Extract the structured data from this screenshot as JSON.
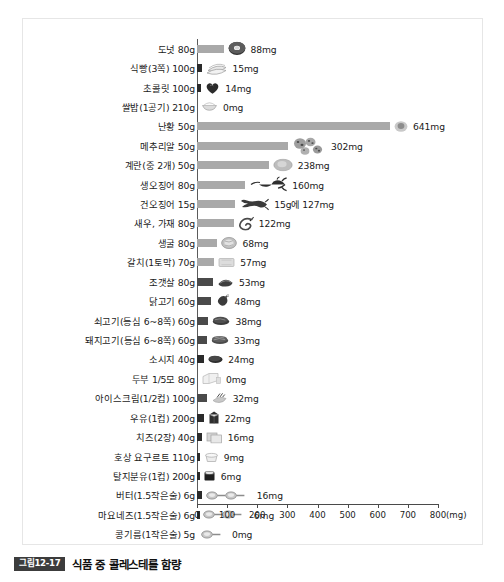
{
  "figure": {
    "caption_badge": "그림12-17",
    "caption_title": "식품 중 콜레스테롤 함량"
  },
  "axis": {
    "unit_label": "(mg)",
    "ticks": [
      "0",
      "100",
      "200",
      "300",
      "400",
      "500",
      "600",
      "700",
      "800"
    ]
  },
  "chart_data": {
    "type": "bar",
    "title": "식품 중 콜레스테롤 함량",
    "xlabel": "(mg)",
    "ylabel": "",
    "xlim": [
      0,
      800
    ],
    "grid": false,
    "orientation": "horizontal",
    "legend": "none",
    "unit": "mg",
    "categories": [
      "도넛 80g",
      "식빵(3쪽) 100g",
      "초콜릿 100g",
      "쌀밥(1공기) 210g",
      "난황 50g",
      "메추리알 50g",
      "계란(중 2개) 50g",
      "생오징어 80g",
      "건오징어 15g",
      "새우, 가재 80g",
      "생굴 80g",
      "갈치(1토막) 70g",
      "조갯살 80g",
      "닭고기 60g",
      "쇠고기(등심 6~8쪽) 60g",
      "돼지고기(등심 6~8쪽) 60g",
      "소시지 40g",
      "두부 1/5모 80g",
      "아이스크림(1/2컵) 100g",
      "우유(1컵) 200g",
      "치즈(2장) 40g",
      "호상 요구르트 110g",
      "탈지분유(1컵) 200g",
      "버터(1.5작은술) 6g",
      "마요네즈(1.5작은술) 6g",
      "콩기름(1작은술) 5g"
    ],
    "values": [
      88,
      15,
      14,
      0,
      641,
      302,
      238,
      160,
      127,
      122,
      68,
      57,
      53,
      48,
      38,
      33,
      24,
      0,
      32,
      22,
      16,
      9,
      6,
      16,
      6,
      0
    ],
    "value_labels": [
      "88mg",
      "15mg",
      "14mg",
      "0mg",
      "641mg",
      "302mg",
      "238mg",
      "160mg",
      "15g에 127mg",
      "122mg",
      "68mg",
      "57mg",
      "53mg",
      "48mg",
      "38mg",
      "33mg",
      "24mg",
      "0mg",
      "32mg",
      "22mg",
      "16mg",
      "9mg",
      "6mg",
      "16mg",
      "6mg",
      "0mg"
    ],
    "icons": [
      "donut-icon",
      "bread-slices-icon",
      "chocolate-heart-icon",
      "rice-bowl-icon",
      "egg-yolk-icon",
      "quail-eggs-icon",
      "boiled-egg-icon",
      "squid-icon",
      "dried-squid-icon",
      "shrimp-icon",
      "oyster-icon",
      "hairtail-fish-icon",
      "clam-icon",
      "chicken-drumstick-icon",
      "beef-slices-icon",
      "pork-slices-icon",
      "sausage-icon",
      "tofu-icon",
      "ice-cream-icon",
      "milk-carton-icon",
      "cheese-slices-icon",
      "yogurt-cup-icon",
      "milk-powder-icon",
      "butter-spoons-icon",
      "mayonnaise-spoons-icon",
      "soybean-oil-spoon-icon"
    ]
  },
  "colors": {
    "bar_gray": "#a9a9a9",
    "bar_dark": "#4a4a4a",
    "badge_bg": "#3c3c3c",
    "text": "#1a1a1a"
  }
}
